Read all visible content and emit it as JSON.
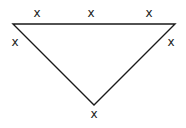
{
  "diagram": {
    "shape": "inverted-triangle",
    "stroke_color": "#1a1a1a",
    "vertices": [
      {
        "id": "top-left",
        "x": 13,
        "y": 24
      },
      {
        "id": "top-right",
        "x": 175,
        "y": 24
      },
      {
        "id": "bottom",
        "x": 94,
        "y": 105
      }
    ],
    "marks": [
      {
        "label": "x",
        "x": 37,
        "y": 17
      },
      {
        "label": "x",
        "x": 91,
        "y": 17
      },
      {
        "label": "x",
        "x": 149,
        "y": 17
      },
      {
        "label": "x",
        "x": 15,
        "y": 46
      },
      {
        "label": "x",
        "x": 171,
        "y": 46
      },
      {
        "label": "x",
        "x": 94,
        "y": 118
      }
    ]
  }
}
